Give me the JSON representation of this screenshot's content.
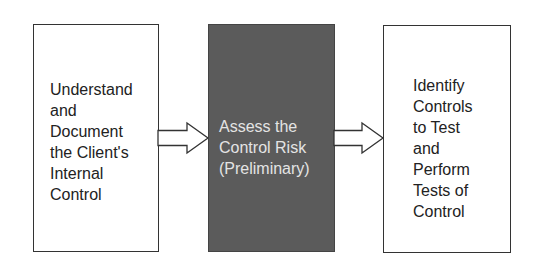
{
  "diagram": {
    "type": "flowchart",
    "direction": "left-to-right",
    "colors": {
      "box_border": "#333333",
      "highlight_fill": "#5b5b5b",
      "highlight_text": "#e4e4e4",
      "text": "#222222",
      "arrow_fill": "#ffffff"
    },
    "steps": [
      {
        "label": "Understand\nand\nDocument\nthe Client's\nInternal\nControl",
        "highlighted": false
      },
      {
        "label": "Assess the\nControl Risk\n(Preliminary)",
        "highlighted": true
      },
      {
        "label": "Identify\nControls\nto Test\nand\nPerform\nTests of\nControl",
        "highlighted": false
      }
    ],
    "connectors": [
      {
        "from": 0,
        "to": 1,
        "icon": "block-arrow-right"
      },
      {
        "from": 1,
        "to": 2,
        "icon": "block-arrow-right"
      }
    ]
  }
}
